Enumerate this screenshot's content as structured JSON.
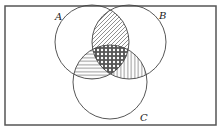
{
  "diagram": {
    "type": "venn",
    "sets": [
      {
        "id": "A",
        "label": "A",
        "cx": 92,
        "cy": 42,
        "r": 37
      },
      {
        "id": "B",
        "label": "B",
        "cx": 129,
        "cy": 42,
        "r": 37
      },
      {
        "id": "C",
        "label": "C",
        "cx": 110,
        "cy": 82,
        "r": 37
      }
    ],
    "regions": [
      {
        "id": "A∩B only",
        "pattern": "diagonal-hatch"
      },
      {
        "id": "A∩C only",
        "pattern": "horizontal-lines"
      },
      {
        "id": "B∩C only",
        "pattern": "vertical-lines"
      },
      {
        "id": "A∩B∩C",
        "pattern": "crosshatch-dots"
      }
    ],
    "labels": {
      "a": "A",
      "b": "B",
      "c": "C"
    },
    "colors": {
      "stroke": "#333333",
      "background": "#ffffff"
    }
  }
}
